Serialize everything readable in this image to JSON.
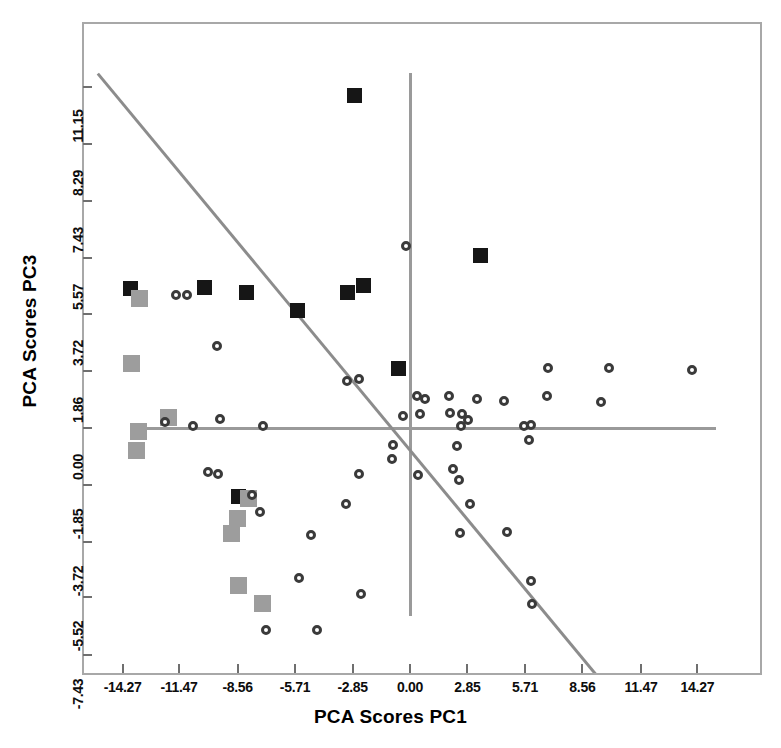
{
  "chart_data": {
    "type": "scatter",
    "title": "",
    "xlabel": "PCA Scores PC1",
    "ylabel": "PCA Scores PC3",
    "xlim": [
      -16.8,
      16.8
    ],
    "ylim": [
      -9.3,
      12.2
    ],
    "grid": false,
    "legend_position": "none",
    "xticks": [
      "-14.27",
      "-11.47",
      "-8.56",
      "-5.71",
      "-2.85",
      "0.00",
      "2.85",
      "5.71",
      "8.56",
      "11.47",
      "14.27"
    ],
    "xtick_values": [
      -14.27,
      -11.47,
      -8.56,
      -5.71,
      -2.85,
      0.0,
      2.85,
      5.71,
      8.56,
      11.47,
      14.27
    ],
    "yticks": [
      "11.15",
      "8.29",
      "7.43",
      "5.57",
      "3.72",
      "1.86",
      "0.00",
      "-1.85",
      "-3.72",
      "-5.52",
      "-7.43"
    ],
    "ytick_values": [
      11.15,
      9.29,
      7.43,
      5.57,
      3.72,
      1.86,
      0.0,
      -1.85,
      -3.72,
      -5.52,
      -7.43
    ],
    "reference_lines": {
      "horizontal_y": 0.0,
      "vertical_x": 0.0,
      "diagonal": {
        "x1": -15.5,
        "y1": 11.6,
        "x2": 9.9,
        "y2": -8.6
      }
    },
    "series": [
      {
        "name": "black-square",
        "marker": "filled-square",
        "color": "#161616",
        "points": [
          [
            -2.75,
            10.9
          ],
          [
            -13.9,
            4.55
          ],
          [
            -10.2,
            4.6
          ],
          [
            -8.1,
            4.45
          ],
          [
            -3.1,
            4.45
          ],
          [
            -2.3,
            4.65
          ],
          [
            3.5,
            5.65
          ],
          [
            -5.6,
            3.85
          ],
          [
            -0.55,
            1.95
          ],
          [
            -8.5,
            -2.25
          ]
        ]
      },
      {
        "name": "gray-square",
        "marker": "filled-square",
        "color": "#9d9d9d",
        "points": [
          [
            -13.45,
            4.25
          ],
          [
            -13.85,
            2.1
          ],
          [
            -12.0,
            0.35
          ],
          [
            -13.5,
            -0.1
          ],
          [
            -13.6,
            -0.75
          ],
          [
            -8.0,
            -2.3
          ],
          [
            -8.55,
            -2.95
          ],
          [
            -8.85,
            -3.45
          ],
          [
            -8.5,
            -5.15
          ],
          [
            -7.3,
            -5.75
          ]
        ]
      },
      {
        "name": "open-circle",
        "marker": "open-circle",
        "color": "#3a3a3a",
        "points": [
          [
            -11.6,
            4.35
          ],
          [
            -11.05,
            4.35
          ],
          [
            -9.6,
            2.7
          ],
          [
            -12.15,
            0.2
          ],
          [
            -10.75,
            0.05
          ],
          [
            -9.45,
            0.3
          ],
          [
            -7.3,
            0.05
          ],
          [
            -10.05,
            -1.45
          ],
          [
            -9.55,
            -1.5
          ],
          [
            -7.85,
            -2.2
          ],
          [
            -7.45,
            -2.75
          ],
          [
            -4.9,
            -3.5
          ],
          [
            -5.5,
            -4.9
          ],
          [
            -7.15,
            -6.6
          ],
          [
            -4.6,
            -6.6
          ],
          [
            -2.45,
            -5.45
          ],
          [
            -2.55,
            -1.5
          ],
          [
            -3.2,
            -2.5
          ],
          [
            -3.15,
            1.55
          ],
          [
            -2.55,
            1.6
          ],
          [
            -0.2,
            5.95
          ],
          [
            0.35,
            1.05
          ],
          [
            0.75,
            0.95
          ],
          [
            0.5,
            0.45
          ],
          [
            -0.35,
            0.4
          ],
          [
            -0.85,
            -0.55
          ],
          [
            -0.9,
            -1.0
          ],
          [
            0.4,
            -1.55
          ],
          [
            1.95,
            1.05
          ],
          [
            2.0,
            0.5
          ],
          [
            2.6,
            0.45
          ],
          [
            2.55,
            0.05
          ],
          [
            2.9,
            0.25
          ],
          [
            3.35,
            0.95
          ],
          [
            4.65,
            0.9
          ],
          [
            2.35,
            -0.6
          ],
          [
            2.15,
            -1.35
          ],
          [
            2.45,
            -1.7
          ],
          [
            3.0,
            -2.5
          ],
          [
            2.5,
            -3.45
          ],
          [
            5.65,
            0.05
          ],
          [
            6.0,
            0.1
          ],
          [
            5.9,
            -0.4
          ],
          [
            4.8,
            -3.4
          ],
          [
            6.0,
            -5.0
          ],
          [
            6.05,
            -5.75
          ],
          [
            6.8,
            1.05
          ],
          [
            6.85,
            1.95
          ],
          [
            9.9,
            1.95
          ],
          [
            9.5,
            0.85
          ],
          [
            14.0,
            1.9
          ]
        ]
      }
    ]
  },
  "axis": {
    "x_title": "PCA Scores PC1",
    "y_title": "PCA Scores PC3"
  }
}
